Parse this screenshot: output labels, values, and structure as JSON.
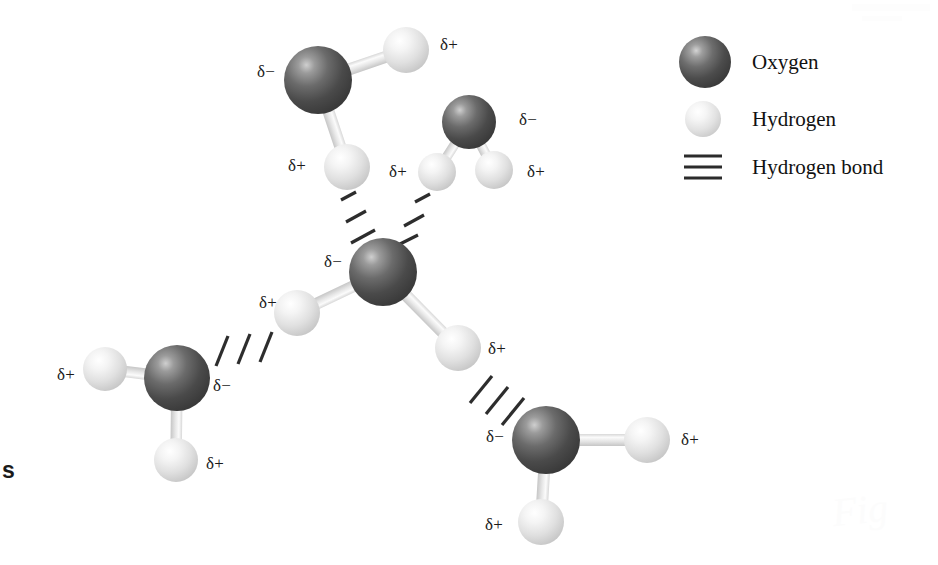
{
  "figure": {
    "background_color": "#ffffff",
    "width": 938,
    "height": 565
  },
  "legend": {
    "items": [
      {
        "key": "oxygen",
        "label": "Oxygen",
        "icon": "oxygen-sphere-icon",
        "color": "#4a4a4a",
        "cx": 705,
        "cy": 62,
        "r": 26
      },
      {
        "key": "hydrogen",
        "label": "Hydrogen",
        "icon": "hydrogen-sphere-icon",
        "color": "#e2e2e2",
        "cx": 703,
        "cy": 119,
        "r": 18
      },
      {
        "key": "hydrogen_bond",
        "label": "Hydrogen bond",
        "icon": "hydrogen-bond-icon",
        "color": "#2b2b2b",
        "cx": 703,
        "cy": 167,
        "r": 0
      }
    ],
    "text_x": 752
  },
  "charge_symbols": {
    "negative": "δ−",
    "positive": "δ+"
  },
  "molecules": [
    {
      "id": "top-left-molecule",
      "name": "water-molecule-top-left",
      "oxygen": {
        "cx": 318,
        "cy": 80,
        "r": 34,
        "charge": "δ−",
        "label_x": 266,
        "label_y": 72
      },
      "hydrogens": [
        {
          "cx": 406,
          "cy": 50,
          "r": 23,
          "charge": "δ+",
          "label_x": 449,
          "label_y": 45
        },
        {
          "cx": 347,
          "cy": 167,
          "r": 23,
          "charge": "δ+",
          "label_x": 297,
          "label_y": 166
        }
      ]
    },
    {
      "id": "top-right-molecule",
      "name": "water-molecule-top-right",
      "oxygen": {
        "cx": 469,
        "cy": 122,
        "r": 27,
        "charge": "δ−",
        "label_x": 528,
        "label_y": 120
      },
      "hydrogens": [
        {
          "cx": 437,
          "cy": 172,
          "r": 19,
          "charge": "δ+",
          "label_x": 398,
          "label_y": 172
        },
        {
          "cx": 494,
          "cy": 170,
          "r": 19,
          "charge": "δ+",
          "label_x": 536,
          "label_y": 172
        }
      ]
    },
    {
      "id": "center-molecule",
      "name": "water-molecule-center",
      "oxygen": {
        "cx": 383,
        "cy": 272,
        "r": 34,
        "charge": "δ−",
        "label_x": 333,
        "label_y": 262
      },
      "hydrogens": [
        {
          "cx": 297,
          "cy": 313,
          "r": 23,
          "charge": "δ+",
          "label_x": 268,
          "label_y": 303
        },
        {
          "cx": 458,
          "cy": 348,
          "r": 23,
          "charge": "δ+",
          "label_x": 497,
          "label_y": 349
        }
      ]
    },
    {
      "id": "bottom-left-molecule",
      "name": "water-molecule-bottom-left",
      "oxygen": {
        "cx": 177,
        "cy": 378,
        "r": 33,
        "charge": "δ−",
        "label_x": 222,
        "label_y": 386
      },
      "hydrogens": [
        {
          "cx": 105,
          "cy": 369,
          "r": 22,
          "charge": "δ+",
          "label_x": 66,
          "label_y": 375
        },
        {
          "cx": 176,
          "cy": 460,
          "r": 22,
          "charge": "δ+",
          "label_x": 215,
          "label_y": 464
        }
      ]
    },
    {
      "id": "bottom-right-molecule",
      "name": "water-molecule-bottom-right",
      "oxygen": {
        "cx": 546,
        "cy": 440,
        "r": 34,
        "charge": "δ−",
        "label_x": 495,
        "label_y": 437
      },
      "hydrogens": [
        {
          "cx": 647,
          "cy": 440,
          "r": 23,
          "charge": "δ+",
          "label_x": 690,
          "label_y": 440
        },
        {
          "cx": 541,
          "cy": 522,
          "r": 23,
          "charge": "δ+",
          "label_x": 494,
          "label_y": 525
        }
      ]
    }
  ],
  "hydrogen_bonds": [
    {
      "id": "hbond-top-left",
      "name": "hydrogen-bond-top-left",
      "dash_count": 3,
      "angle": 22,
      "dashes": [
        {
          "x1": 341,
          "y1": 200,
          "x2": 356,
          "y2": 192
        },
        {
          "x1": 346,
          "y1": 222,
          "x2": 366,
          "y2": 211
        },
        {
          "x1": 351,
          "y1": 243,
          "x2": 375,
          "y2": 230
        }
      ]
    },
    {
      "id": "hbond-top-right",
      "name": "hydrogen-bond-top-right",
      "dash_count": 3,
      "angle": -22,
      "dashes": [
        {
          "x1": 430,
          "y1": 194,
          "x2": 415,
          "y2": 202
        },
        {
          "x1": 424,
          "y1": 215,
          "x2": 404,
          "y2": 226
        },
        {
          "x1": 418,
          "y1": 235,
          "x2": 394,
          "y2": 247
        }
      ]
    },
    {
      "id": "hbond-lower-left",
      "name": "hydrogen-bond-lower-left",
      "dash_count": 3,
      "angle": 70,
      "dashes": [
        {
          "x1": 216,
          "y1": 366,
          "x2": 228,
          "y2": 336
        },
        {
          "x1": 238,
          "y1": 364,
          "x2": 250,
          "y2": 334
        },
        {
          "x1": 260,
          "y1": 362,
          "x2": 272,
          "y2": 332
        }
      ]
    },
    {
      "id": "hbond-lower-right",
      "name": "hydrogen-bond-lower-right",
      "dash_count": 3,
      "angle": -52,
      "dashes": [
        {
          "x1": 470,
          "y1": 403,
          "x2": 492,
          "y2": 376
        },
        {
          "x1": 486,
          "y1": 414,
          "x2": 508,
          "y2": 387
        },
        {
          "x1": 502,
          "y1": 425,
          "x2": 524,
          "y2": 398
        }
      ]
    }
  ],
  "edge_fragment": {
    "text": "s",
    "x": 2,
    "y": 470
  },
  "watermark": {
    "text": "Fig",
    "x": 860,
    "y": 510
  }
}
